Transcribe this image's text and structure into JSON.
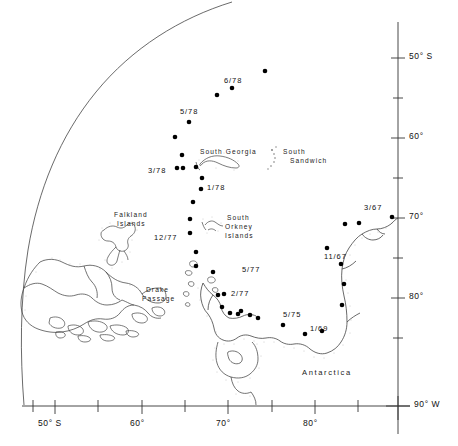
{
  "figure": {
    "kind": "map",
    "title": "",
    "projection": "polar-quadrant",
    "region": "Scotia Sea / Antarctic Peninsula / Weddell Sea",
    "colors": {
      "background": "#ffffff",
      "line": "#333333",
      "coast": "#444444",
      "shelf_stipple": "#999999",
      "dot": "#000000",
      "text": "#111111"
    }
  },
  "axes": {
    "right": {
      "label_suffix": "S",
      "ticks": [
        {
          "value": "50° S",
          "y": 58,
          "major": true
        },
        {
          "value": "",
          "y": 98,
          "major": false
        },
        {
          "value": "60°",
          "y": 138,
          "major": true
        },
        {
          "value": "",
          "y": 178,
          "major": false
        },
        {
          "value": "70°",
          "y": 218,
          "major": true
        },
        {
          "value": "",
          "y": 258,
          "major": false
        },
        {
          "value": "80°",
          "y": 298,
          "major": true
        },
        {
          "value": "",
          "y": 338,
          "major": false
        },
        {
          "value": "90° W",
          "y": 406,
          "major": true
        }
      ]
    },
    "bottom": {
      "ticks": [
        {
          "value": "",
          "x": 33,
          "major": false
        },
        {
          "value": "50° S",
          "x": 55,
          "major": true
        },
        {
          "value": "",
          "x": 98,
          "major": false
        },
        {
          "value": "60°",
          "x": 142,
          "major": true
        },
        {
          "value": "",
          "x": 185,
          "major": false
        },
        {
          "value": "70°",
          "x": 228,
          "major": true
        },
        {
          "value": "",
          "x": 272,
          "major": false
        },
        {
          "value": "80°",
          "x": 315,
          "major": true
        },
        {
          "value": "",
          "x": 358,
          "major": false
        }
      ]
    }
  },
  "place_labels": [
    {
      "name": "south-georgia",
      "text": "South Georgia",
      "x": 205,
      "y": 152
    },
    {
      "name": "south-sandwich",
      "text": "South",
      "text2": "Sandwich",
      "x": 288,
      "y": 152
    },
    {
      "name": "falkland-islands",
      "text": "Falkland",
      "text2": "Islands",
      "x": 118,
      "y": 215
    },
    {
      "name": "south-orkney-islands",
      "text": "South",
      "text2": "Orkney",
      "text3": "Islands",
      "x": 222,
      "y": 218
    },
    {
      "name": "drake-passage",
      "text": "Drake",
      "text2": "Passage",
      "x": 146,
      "y": 290
    },
    {
      "name": "antarctica",
      "text": "Antarctica",
      "x": 305,
      "y": 373
    }
  ],
  "station_labels": [
    {
      "name": "label-6-78",
      "text": "6/78",
      "x": 224,
      "y": 81
    },
    {
      "name": "label-5-78",
      "text": "5/78",
      "x": 180,
      "y": 112
    },
    {
      "name": "label-3-78",
      "text": "3/78",
      "x": 150,
      "y": 171
    },
    {
      "name": "label-1-78",
      "text": "1/78",
      "x": 204,
      "y": 188
    },
    {
      "name": "label-12-77",
      "text": "12/77",
      "x": 156,
      "y": 237
    },
    {
      "name": "label-5-77",
      "text": "5/77",
      "x": 244,
      "y": 268
    },
    {
      "name": "label-2-77",
      "text": "2/77",
      "x": 225,
      "y": 294
    },
    {
      "name": "label-5-75",
      "text": "5/75",
      "x": 285,
      "y": 315
    },
    {
      "name": "label-1-69",
      "text": "1/69",
      "x": 313,
      "y": 330
    },
    {
      "name": "label-11-67",
      "text": "11/67",
      "x": 326,
      "y": 258
    },
    {
      "name": "label-3-67",
      "text": "3/67",
      "x": 367,
      "y": 208
    }
  ],
  "chart_data": {
    "type": "scatter",
    "title": "",
    "xlabel": "Longitude (° W)",
    "ylabel": "Latitude (° S)",
    "series": [
      {
        "name": "ice-edge-stations",
        "points": [
          {
            "x": 265,
            "y": 71
          },
          {
            "x": 232,
            "y": 88
          },
          {
            "x": 217,
            "y": 95
          },
          {
            "x": 189,
            "y": 122
          },
          {
            "x": 175,
            "y": 137
          },
          {
            "x": 182,
            "y": 155
          },
          {
            "x": 177,
            "y": 168
          },
          {
            "x": 183,
            "y": 168
          },
          {
            "x": 196,
            "y": 167
          },
          {
            "x": 202,
            "y": 178
          },
          {
            "x": 201,
            "y": 189
          },
          {
            "x": 193,
            "y": 202
          },
          {
            "x": 190,
            "y": 219
          },
          {
            "x": 190,
            "y": 233
          },
          {
            "x": 196,
            "y": 252
          },
          {
            "x": 196,
            "y": 266
          },
          {
            "x": 213,
            "y": 272
          },
          {
            "x": 218,
            "y": 295
          },
          {
            "x": 224,
            "y": 294
          },
          {
            "x": 222,
            "y": 307
          },
          {
            "x": 230,
            "y": 313
          },
          {
            "x": 238,
            "y": 314
          },
          {
            "x": 241,
            "y": 311
          },
          {
            "x": 250,
            "y": 315
          },
          {
            "x": 258,
            "y": 318
          },
          {
            "x": 283,
            "y": 325
          },
          {
            "x": 305,
            "y": 334
          },
          {
            "x": 322,
            "y": 331
          },
          {
            "x": 342,
            "y": 305
          },
          {
            "x": 344,
            "y": 284
          },
          {
            "x": 341,
            "y": 264
          },
          {
            "x": 327,
            "y": 248
          },
          {
            "x": 345,
            "y": 224
          },
          {
            "x": 359,
            "y": 223
          },
          {
            "x": 392,
            "y": 217
          }
        ]
      }
    ]
  }
}
